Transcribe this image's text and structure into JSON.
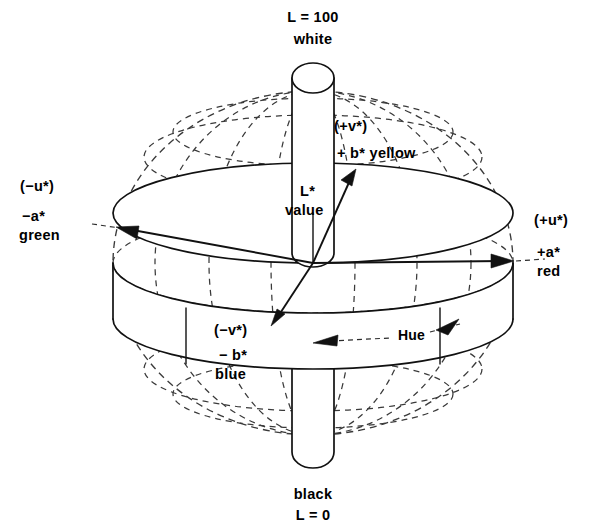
{
  "figure": {
    "kind": "cielab-cieluv-color-solid-diagram",
    "background_color": "#ffffff",
    "line_color": "#111111",
    "dashed_line_color": "#3a3a3a"
  },
  "labels": {
    "top": {
      "line1": "L = 100",
      "line2": "white"
    },
    "bottom": {
      "line1": "black",
      "line2": "L = 0"
    },
    "left": {
      "line1": "(−u*)",
      "line2": "−a*",
      "line3": "green"
    },
    "right": {
      "line1": "(+u*)",
      "line2": "+a*",
      "line3": "red"
    },
    "upper_right": {
      "line1": "(+v*)",
      "line2": "+ b* yellow"
    },
    "lower_left": {
      "line1": "(−v*)",
      "line2": "− b*",
      "line3": "blue"
    },
    "center_axis": {
      "line1": "L*",
      "line2": "value"
    },
    "hue": "Hue"
  },
  "geometry": {
    "sphere_center_x": 313,
    "sphere_center_y": 263,
    "sphere_radius_x": 200,
    "sphere_radius_y": 172,
    "disc_radius_x": 200,
    "disc_radius_y": 50,
    "disc_thickness": 56,
    "cylinder_half_width": 21,
    "cylinder_top_y": 62,
    "cylinder_bottom_y": 470
  }
}
